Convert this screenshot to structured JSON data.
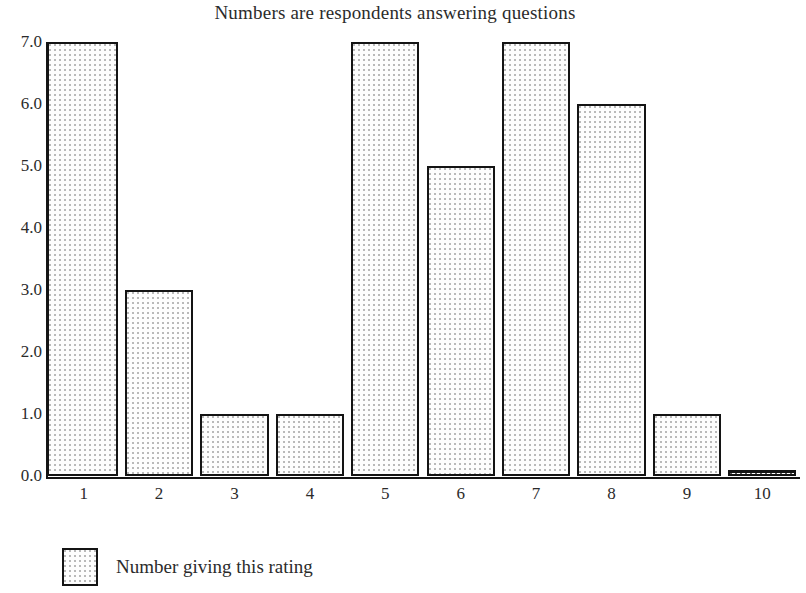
{
  "chart_data": {
    "type": "bar",
    "title": "Numbers are respondents answering questions",
    "xlabel": "",
    "ylabel": "",
    "categories": [
      "1",
      "2",
      "3",
      "4",
      "5",
      "6",
      "7",
      "8",
      "9",
      "10"
    ],
    "values": [
      7,
      3,
      1,
      1,
      7,
      5,
      7,
      6,
      1,
      0
    ],
    "series": [
      {
        "name": "Number giving this rating",
        "values": [
          7,
          3,
          1,
          1,
          7,
          5,
          7,
          6,
          1,
          0
        ]
      }
    ],
    "ylim": [
      0,
      7
    ],
    "ytick_labels": [
      "0.0",
      "1.0",
      "2.0",
      "3.0",
      "4.0",
      "5.0",
      "6.0",
      "7.0"
    ],
    "ytick_values": [
      0,
      1,
      2,
      3,
      4,
      5,
      6,
      7
    ],
    "xtick_labels": [
      "1",
      "2",
      "3",
      "4",
      "5",
      "6",
      "7",
      "8",
      "9",
      "10"
    ],
    "grid": false,
    "legend_position": "below-left",
    "legend": [
      {
        "label": "Number giving this rating",
        "swatch": "dotted-fill"
      }
    ],
    "colors": {
      "bar_outline": "#141414",
      "bar_fill": "#fdfdfd",
      "bar_stipple": "#b9b9b9",
      "axis": "#141414",
      "text": "#2b2b2b",
      "background": "#ffffff"
    }
  }
}
